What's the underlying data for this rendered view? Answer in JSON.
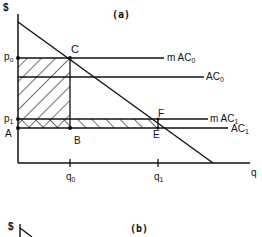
{
  "panel_a": {
    "title": "(a)",
    "y_axis_label": "$",
    "x_axis_label": "q",
    "price_labels": {
      "p0": "p",
      "p0_sub": "o",
      "p1": "p",
      "p1_sub": "1",
      "A": "A"
    },
    "points": {
      "C": "C",
      "B": "B",
      "F": "F",
      "E": "E"
    },
    "quantity_ticks": {
      "q0": "q",
      "q0_sub": "0",
      "q1": "q",
      "q1_sub": "1"
    },
    "curves": {
      "mAC0": {
        "prefix": "m AC",
        "sub": "0"
      },
      "AC0": {
        "prefix": "AC",
        "sub": "0"
      },
      "mAC1": {
        "prefix": "m AC",
        "sub": "1"
      },
      "AC1": {
        "prefix": "AC",
        "sub": "1"
      }
    }
  },
  "panel_b": {
    "title": "(b)",
    "y_axis_label": "$"
  },
  "colors": {
    "ink": "#111111",
    "background": "#ffffff"
  }
}
